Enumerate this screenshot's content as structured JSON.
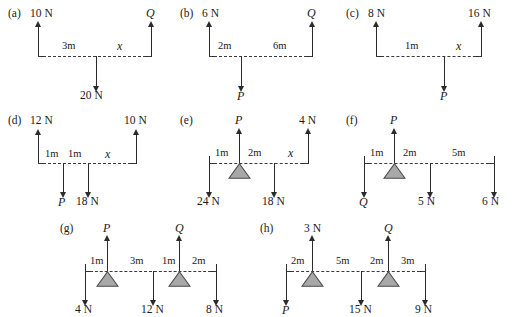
{
  "figure": {
    "type": "mechanics-free-body-diagrams",
    "background_color": "#ffffff",
    "line_color": "#2b2b2b",
    "fulcrum_fill": "#a8a8a8",
    "beam_style": "dashed"
  },
  "diagrams": [
    {
      "tag": "(a)",
      "supports": [
        {
          "label": "10 N",
          "direction": "up",
          "position": "left-end"
        },
        {
          "label": "Q",
          "direction": "up",
          "position": "right-end",
          "italic": true
        }
      ],
      "loads": [
        {
          "label": "20 N",
          "direction": "down",
          "position": "interior"
        }
      ],
      "dimensions": [
        "3m",
        "x"
      ],
      "fulcrums": 0
    },
    {
      "tag": "(b)",
      "supports": [
        {
          "label": "6 N",
          "direction": "up",
          "position": "left-end"
        },
        {
          "label": "Q",
          "direction": "up",
          "position": "right-end",
          "italic": true
        }
      ],
      "loads": [
        {
          "label": "P",
          "direction": "down",
          "position": "interior",
          "italic": true
        }
      ],
      "dimensions": [
        "2m",
        "6m"
      ],
      "fulcrums": 0
    },
    {
      "tag": "(c)",
      "supports": [
        {
          "label": "8 N",
          "direction": "up",
          "position": "left-end"
        },
        {
          "label": "16 N",
          "direction": "up",
          "position": "right-end"
        }
      ],
      "loads": [
        {
          "label": "P",
          "direction": "down",
          "position": "interior",
          "italic": true
        }
      ],
      "dimensions": [
        "1m",
        "x"
      ],
      "fulcrums": 0
    },
    {
      "tag": "(d)",
      "supports": [
        {
          "label": "12 N",
          "direction": "up",
          "position": "left-end"
        },
        {
          "label": "10 N",
          "direction": "up",
          "position": "right-end"
        }
      ],
      "loads": [
        {
          "label": "P",
          "direction": "down",
          "position": "interior",
          "italic": true
        },
        {
          "label": "18 N",
          "direction": "down",
          "position": "interior"
        }
      ],
      "dimensions": [
        "1m",
        "1m",
        "x"
      ],
      "fulcrums": 0
    },
    {
      "tag": "(e)",
      "supports": [
        {
          "label": "P",
          "direction": "up",
          "position": "fulcrum",
          "italic": true
        },
        {
          "label": "4 N",
          "direction": "up",
          "position": "right-end"
        }
      ],
      "loads": [
        {
          "label": "24 N",
          "direction": "down",
          "position": "left-end"
        },
        {
          "label": "18 N",
          "direction": "down",
          "position": "interior"
        }
      ],
      "dimensions": [
        "1m",
        "2m",
        "x"
      ],
      "fulcrums": 1
    },
    {
      "tag": "(f)",
      "supports": [
        {
          "label": "P",
          "direction": "up",
          "position": "fulcrum",
          "italic": true
        }
      ],
      "loads": [
        {
          "label": "Q",
          "direction": "down",
          "position": "left-end",
          "italic": true
        },
        {
          "label": "5 N",
          "direction": "down",
          "position": "interior"
        },
        {
          "label": "6 N",
          "direction": "down",
          "position": "right-end"
        }
      ],
      "dimensions": [
        "1m",
        "2m",
        "5m"
      ],
      "fulcrums": 1
    },
    {
      "tag": "(g)",
      "supports": [
        {
          "label": "P",
          "direction": "up",
          "position": "fulcrum",
          "italic": true
        },
        {
          "label": "Q",
          "direction": "up",
          "position": "fulcrum",
          "italic": true
        }
      ],
      "loads": [
        {
          "label": "4 N",
          "direction": "down",
          "position": "left-end"
        },
        {
          "label": "12 N",
          "direction": "down",
          "position": "interior"
        },
        {
          "label": "8 N",
          "direction": "down",
          "position": "right-end"
        }
      ],
      "dimensions": [
        "1m",
        "3m",
        "1m",
        "2m"
      ],
      "fulcrums": 2
    },
    {
      "tag": "(h)",
      "supports": [
        {
          "label": "3 N",
          "direction": "up",
          "position": "fulcrum"
        },
        {
          "label": "Q",
          "direction": "up",
          "position": "fulcrum",
          "italic": true
        }
      ],
      "loads": [
        {
          "label": "P",
          "direction": "down",
          "position": "left-end",
          "italic": true
        },
        {
          "label": "15 N",
          "direction": "down",
          "position": "interior"
        },
        {
          "label": "9 N",
          "direction": "down",
          "position": "right-end"
        }
      ],
      "dimensions": [
        "2m",
        "5m",
        "2m",
        "3m"
      ],
      "fulcrums": 2
    }
  ],
  "labels": {
    "a_tag": "(a)",
    "a_left": "10 N",
    "a_right": "Q",
    "a_d1": "3m",
    "a_d2": "x",
    "a_load": "20 N",
    "b_tag": "(b)",
    "b_left": "6 N",
    "b_right": "Q",
    "b_d1": "2m",
    "b_d2": "6m",
    "b_load": "P",
    "c_tag": "(c)",
    "c_left": "8 N",
    "c_right": "16 N",
    "c_d1": "1m",
    "c_d2": "x",
    "c_load": "P",
    "d_tag": "(d)",
    "d_left": "12 N",
    "d_right": "10 N",
    "d_d1": "1m",
    "d_d2": "1m",
    "d_d3": "x",
    "d_load1": "P",
    "d_load2": "18 N",
    "e_tag": "(e)",
    "e_top1": "P",
    "e_top2": "4 N",
    "e_d1": "1m",
    "e_d2": "2m",
    "e_d3": "x",
    "e_load1": "24 N",
    "e_load2": "18 N",
    "f_tag": "(f)",
    "f_top": "P",
    "f_d1": "1m",
    "f_d2": "2m",
    "f_d3": "5m",
    "f_load1": "Q",
    "f_load2": "5 N",
    "f_load3": "6 N",
    "g_tag": "(g)",
    "g_top1": "P",
    "g_top2": "Q",
    "g_d1": "1m",
    "g_d2": "3m",
    "g_d3": "1m",
    "g_d4": "2m",
    "g_load1": "4 N",
    "g_load2": "12 N",
    "g_load3": "8 N",
    "h_tag": "(h)",
    "h_top1": "3 N",
    "h_top2": "Q",
    "h_d1": "2m",
    "h_d2": "5m",
    "h_d3": "2m",
    "h_d4": "3m",
    "h_load1": "P",
    "h_load2": "15 N",
    "h_load3": "9 N"
  }
}
